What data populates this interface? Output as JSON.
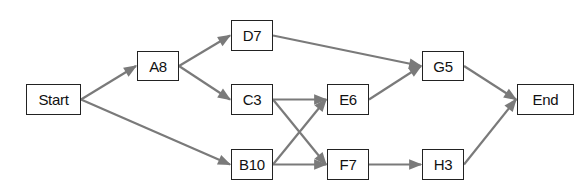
{
  "diagram": {
    "type": "activity-network",
    "edge_color": "#7a7a7a",
    "node_border_color": "#222222",
    "nodes": [
      {
        "id": "start",
        "label": "Start",
        "x": 26,
        "y": 84,
        "w": 55,
        "h": 31
      },
      {
        "id": "A",
        "label": "A8",
        "x": 137,
        "y": 51,
        "w": 42,
        "h": 30
      },
      {
        "id": "D",
        "label": "D7",
        "x": 231,
        "y": 20,
        "w": 42,
        "h": 31
      },
      {
        "id": "C",
        "label": "C3",
        "x": 231,
        "y": 84,
        "w": 42,
        "h": 31
      },
      {
        "id": "B",
        "label": "B10",
        "x": 231,
        "y": 149,
        "w": 42,
        "h": 31
      },
      {
        "id": "E",
        "label": "E6",
        "x": 327,
        "y": 84,
        "w": 42,
        "h": 31
      },
      {
        "id": "F",
        "label": "F7",
        "x": 327,
        "y": 149,
        "w": 42,
        "h": 31
      },
      {
        "id": "G",
        "label": "G5",
        "x": 422,
        "y": 51,
        "w": 42,
        "h": 30
      },
      {
        "id": "H",
        "label": "H3",
        "x": 422,
        "y": 149,
        "w": 42,
        "h": 31
      },
      {
        "id": "end",
        "label": "End",
        "x": 517,
        "y": 84,
        "w": 57,
        "h": 31
      }
    ],
    "edges": [
      {
        "from": "start",
        "to": "A"
      },
      {
        "from": "start",
        "to": "B"
      },
      {
        "from": "A",
        "to": "D"
      },
      {
        "from": "A",
        "to": "C"
      },
      {
        "from": "D",
        "to": "G"
      },
      {
        "from": "C",
        "to": "E"
      },
      {
        "from": "C",
        "to": "F"
      },
      {
        "from": "B",
        "to": "E"
      },
      {
        "from": "B",
        "to": "F"
      },
      {
        "from": "E",
        "to": "G"
      },
      {
        "from": "F",
        "to": "H"
      },
      {
        "from": "G",
        "to": "end"
      },
      {
        "from": "H",
        "to": "end"
      }
    ]
  }
}
